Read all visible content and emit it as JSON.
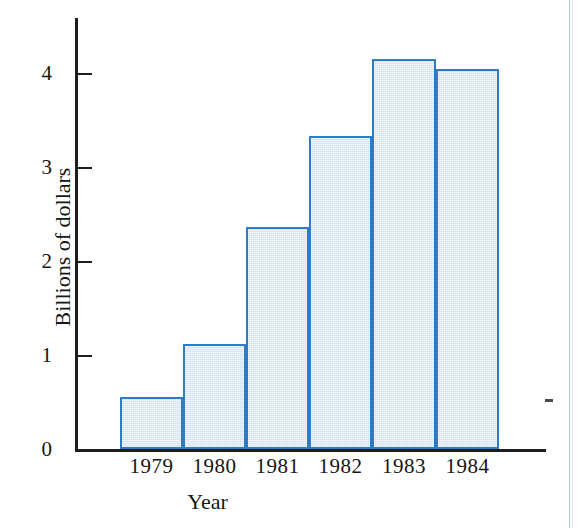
{
  "chart_data": {
    "type": "bar",
    "title": "",
    "subtitle": "",
    "xlabel": "Year",
    "ylabel": "Billions of dollars",
    "categories": [
      "1979",
      "1980",
      "1981",
      "1982",
      "1983",
      "1984"
    ],
    "values": [
      0.55,
      1.12,
      2.36,
      3.33,
      4.15,
      4.04
    ],
    "ylim": [
      0,
      4.6
    ],
    "yticks": [
      0,
      1,
      2,
      3,
      4
    ],
    "ytick_labels": [
      "0",
      "1",
      "2",
      "3",
      "4"
    ],
    "grid": false,
    "legend": null,
    "legend_position": "none",
    "series": [
      {
        "name": "Billions of dollars",
        "values": [
          0.55,
          1.12,
          2.36,
          3.33,
          4.15,
          4.04
        ]
      }
    ],
    "bar_style": {
      "fill_color": "#cfe0f2",
      "edge_color": "#2f7bc4",
      "edge_width": 2,
      "gap": 0
    },
    "axis_color": "#1d1d1d",
    "tick_direction": "in"
  },
  "axes": {
    "y_title": "Billions of dollars",
    "x_title": "Year",
    "y_tick_0": "0",
    "y_tick_1": "1",
    "y_tick_2": "2",
    "y_tick_3": "3",
    "y_tick_4": "4",
    "x_tick_0": "1979",
    "x_tick_1": "1980",
    "x_tick_2": "1981",
    "x_tick_3": "1982",
    "x_tick_4": "1983",
    "x_tick_5": "1984"
  }
}
